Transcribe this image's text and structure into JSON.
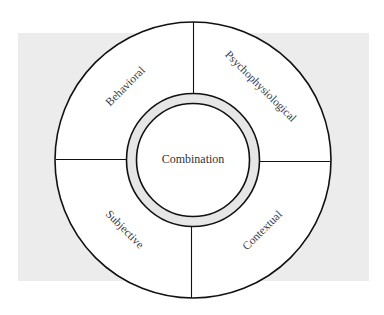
{
  "diagram": {
    "type": "concentric-wheel",
    "background_panel_color": "#ececec",
    "line_color": "#111111",
    "ring_fill_color": "#e6e6e6",
    "center": {
      "label": "Combination"
    },
    "quadrants": [
      {
        "position": "top-left",
        "label": "Behavioral"
      },
      {
        "position": "top-right",
        "label": "Psychophysiological"
      },
      {
        "position": "bottom-left",
        "label": "Subjective"
      },
      {
        "position": "bottom-right",
        "label": "Contextual"
      }
    ]
  }
}
